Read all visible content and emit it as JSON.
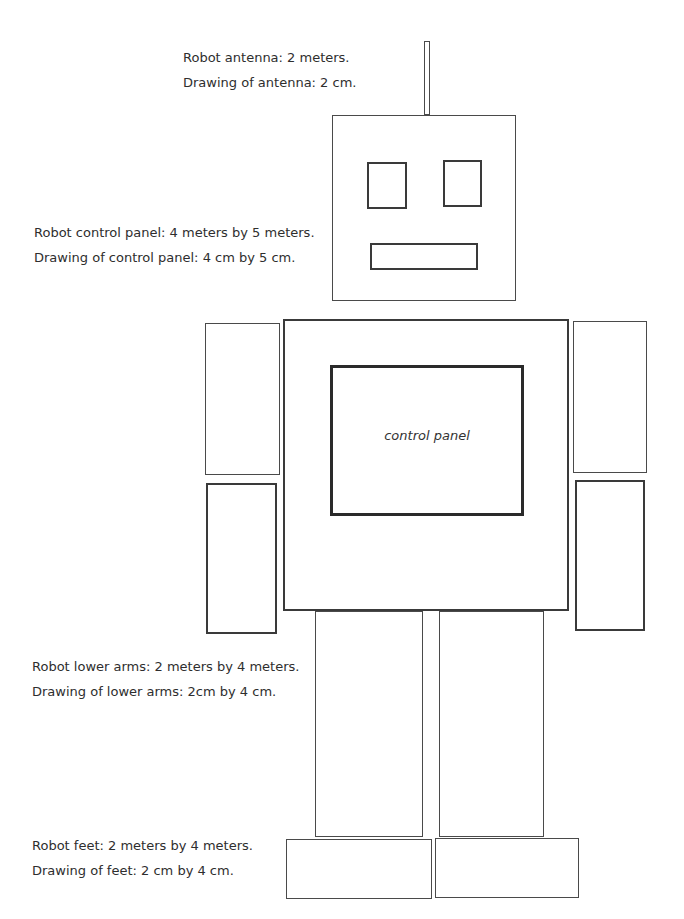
{
  "labels": {
    "antenna": {
      "robot": "Robot antenna: 2 meters.",
      "drawing": "Drawing of antenna: 2 cm."
    },
    "control_panel": {
      "robot": "Robot control panel: 4 meters by 5 meters.",
      "drawing": "Drawing of control panel: 4 cm by 5 cm."
    },
    "lower_arms": {
      "robot": "Robot lower arms: 2 meters by 4 meters.",
      "drawing": "Drawing of lower arms: 2cm by 4 cm."
    },
    "feet": {
      "robot": "Robot feet: 2 meters by 4 meters.",
      "drawing": "Drawing of feet: 2 cm by 4 cm."
    }
  },
  "robot": {
    "control_panel_label": "control panel"
  }
}
